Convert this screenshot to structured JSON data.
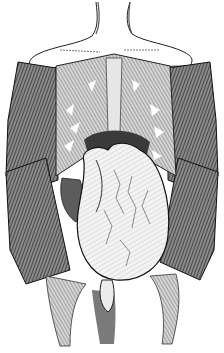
{
  "image": {
    "subject": "anatomical engraving of opened torso with reflected skin flaps",
    "colors": {
      "background": "#ffffff",
      "ink": "#1a1a1a",
      "flap_shade": "#5a5a5a",
      "muscle_shade": "#9a9a9a",
      "organ_fill": "#f2f2f2",
      "skin_fill": "#ffffff"
    }
  },
  "caption": {
    "text": ""
  }
}
